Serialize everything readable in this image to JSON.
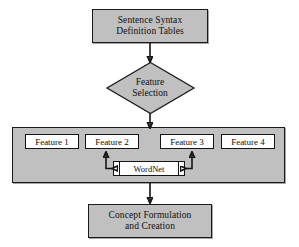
{
  "diagram": {
    "colors": {
      "node_fill": "#c0c0c0",
      "feature_fill": "#ffffff",
      "stroke": "#141414",
      "page_background": "#ffffff"
    },
    "nodes": {
      "source": {
        "label_line1": "Sentence Syntax",
        "label_line2": "Definition Tables",
        "shape": "process"
      },
      "decision": {
        "label_line1": "Feature",
        "label_line2": "Selection",
        "shape": "diamond"
      },
      "features": [
        {
          "label": "Feature 1"
        },
        {
          "label": "Feature 2"
        },
        {
          "label": "Feature 3"
        },
        {
          "label": "Feature 4"
        }
      ],
      "resource": {
        "label": "WordNet",
        "shape": "predefined-process"
      },
      "output": {
        "label_line1": "Concept Formulation",
        "label_line2": "and Creation",
        "shape": "process"
      }
    },
    "edges": [
      {
        "name": "source-to-decision",
        "from": "source",
        "to": "decision",
        "direction": "down",
        "arrowheads": 1
      },
      {
        "name": "decision-to-features",
        "from": "decision",
        "to": "feature-container",
        "direction": "down",
        "arrowheads": 1
      },
      {
        "name": "feature2-wordnet",
        "from": "Feature 2",
        "to": "WordNet",
        "direction": "bidirectional",
        "arrowheads": 2
      },
      {
        "name": "feature3-wordnet",
        "from": "Feature 3",
        "to": "WordNet",
        "direction": "bidirectional",
        "arrowheads": 2
      },
      {
        "name": "features-to-output",
        "from": "feature-container",
        "to": "output",
        "direction": "down",
        "arrowheads": 1
      }
    ]
  }
}
